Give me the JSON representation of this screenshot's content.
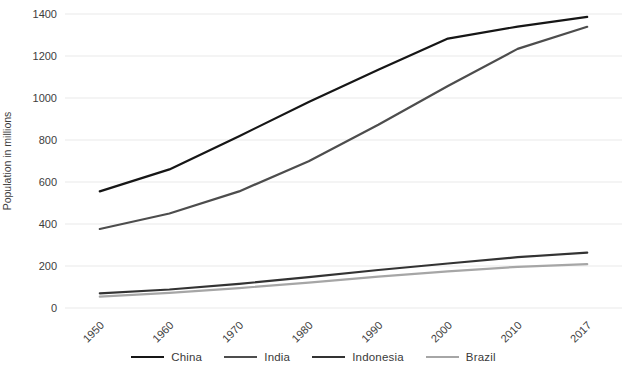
{
  "chart_data": {
    "type": "line",
    "title": "",
    "xlabel": "",
    "ylabel": "Population in millions",
    "categories": [
      "1950",
      "1960",
      "1970",
      "1980",
      "1990",
      "2000",
      "2010",
      "2017"
    ],
    "series": [
      {
        "name": "China",
        "color": "#161616",
        "values": [
          555,
          660,
          818,
          981,
          1135,
          1283,
          1340,
          1386
        ]
      },
      {
        "name": "India",
        "color": "#4d4d4d",
        "values": [
          376,
          450,
          555,
          699,
          873,
          1057,
          1234,
          1339
        ]
      },
      {
        "name": "Indonesia",
        "color": "#333333",
        "values": [
          70,
          88,
          115,
          147,
          181,
          212,
          242,
          264
        ]
      },
      {
        "name": "Brazil",
        "color": "#a6a6a6",
        "values": [
          54,
          72,
          95,
          121,
          149,
          175,
          196,
          209
        ]
      }
    ],
    "ylim": [
      0,
      1400
    ],
    "yticks": [
      0,
      200,
      400,
      600,
      800,
      1000,
      1200,
      1400
    ],
    "grid": true,
    "gridline_color": "#e9e9e9",
    "text_color": "#3d3d3d",
    "legend_position": "bottom"
  }
}
